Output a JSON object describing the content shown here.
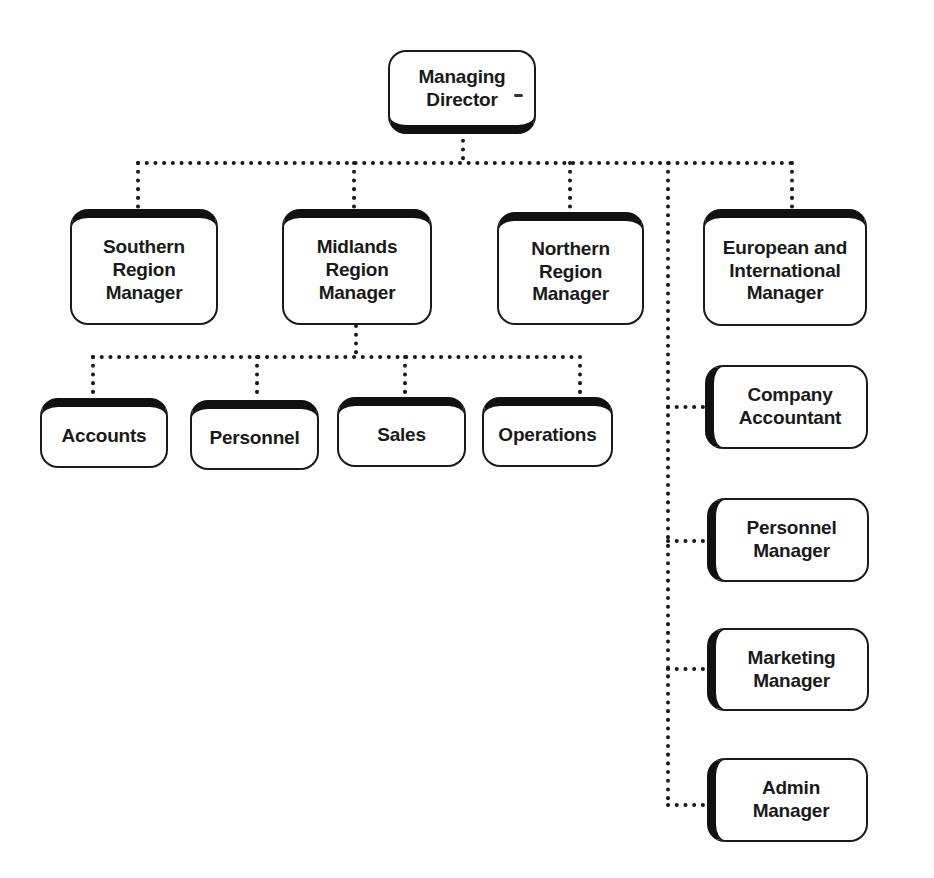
{
  "diagram": {
    "type": "organization-chart",
    "connector_style": "dotted",
    "colors": {
      "line": "#1a1a1a",
      "box_fill": "#ffffff",
      "box_border": "#1a1a1a",
      "text": "#1a1a1a"
    },
    "root": {
      "label": "Managing\nDirector"
    },
    "regional_managers": [
      {
        "label": "Southern\nRegion\nManager"
      },
      {
        "label": "Midlands\nRegion\nManager"
      },
      {
        "label": "Northern\nRegion\nManager"
      },
      {
        "label": "European and\nInternational\nManager"
      }
    ],
    "midlands_departments": [
      {
        "label": "Accounts"
      },
      {
        "label": "Personnel"
      },
      {
        "label": "Sales"
      },
      {
        "label": "Operations"
      }
    ],
    "head_office_staff": [
      {
        "label": "Company\nAccountant"
      },
      {
        "label": "Personnel\nManager"
      },
      {
        "label": "Marketing\nManager"
      },
      {
        "label": "Admin\nManager"
      }
    ]
  }
}
